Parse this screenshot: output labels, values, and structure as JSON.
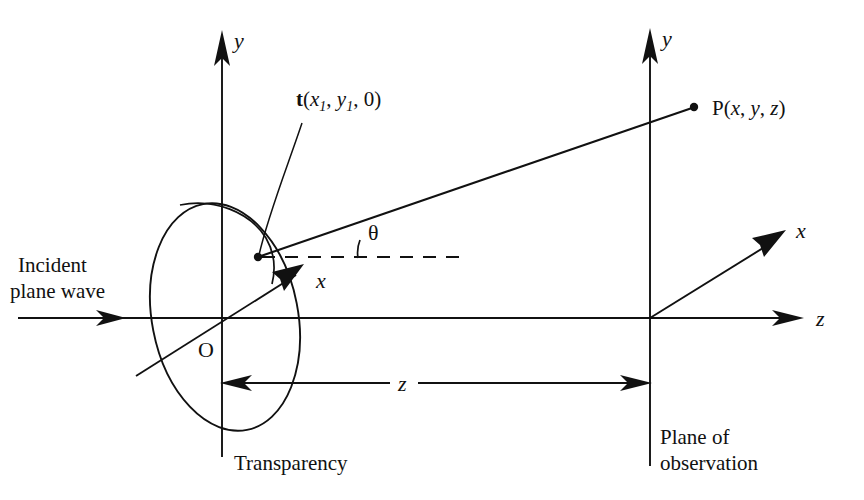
{
  "figure": {
    "background_color": "#ffffff",
    "line_color": "#111111",
    "width": 864,
    "height": 500
  },
  "labels": {
    "y_axis_left": "y",
    "y_axis_right": "y",
    "x_axis_left": "x",
    "x_axis_right": "x",
    "z_axis": "z",
    "origin": "O",
    "theta": "θ",
    "distance_z": "z",
    "incident_line1": "Incident",
    "incident_line2": "plane wave",
    "transparency": "Transparency",
    "plane_line1": "Plane of",
    "plane_line2": "observation"
  },
  "source_point": {
    "symbol": "t",
    "open_paren": "(",
    "coord1": "x",
    "coord1_sub": "1",
    "sep1": ", ",
    "coord2": "y",
    "coord2_sub": "1",
    "sep2": ", ",
    "coord3": "0",
    "close_paren": ")"
  },
  "field_point": {
    "symbol": "P",
    "open_paren": "(",
    "coord1": "x",
    "sep1": ", ",
    "coord2": "y",
    "sep2": ", ",
    "coord3": "z",
    "close_paren": ")"
  },
  "geometry": {
    "transparency_plane_x": 222,
    "observation_plane_x": 650,
    "optical_axis_y": 318,
    "source_point_xy": [
      258,
      257
    ],
    "field_point_xy": [
      694,
      107
    ],
    "ellipse_center": [
      225,
      317
    ],
    "ellipse_rx": 73,
    "ellipse_ry": 115,
    "ellipse_rotation_deg": -11,
    "distance_line_y": 383
  }
}
